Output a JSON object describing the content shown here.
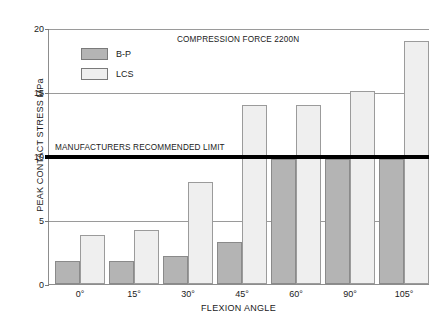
{
  "chart_data": {
    "type": "bar",
    "title": "",
    "annotation": "COMPRESSION FORCE 2200N",
    "xlabel": "FLEXION ANGLE",
    "ylabel": "PEAK CONTACT STRESS MPa",
    "categories": [
      "0°",
      "15°",
      "30°",
      "45°",
      "60°",
      "90°",
      "105°"
    ],
    "series": [
      {
        "name": "B-P",
        "color": "#b4b4b4",
        "values": [
          1.8,
          1.8,
          2.2,
          3.3,
          9.8,
          9.8,
          9.8
        ]
      },
      {
        "name": "LCS",
        "color": "#efefef",
        "values": [
          3.8,
          4.2,
          8.0,
          14.0,
          14.0,
          15.1,
          19.0
        ]
      }
    ],
    "ylim": [
      0,
      20
    ],
    "yticks": [
      0,
      5,
      10,
      15,
      20
    ],
    "ytick_labels": [
      "0",
      "5",
      "10",
      "15",
      "20"
    ],
    "grid": true,
    "legend_position": "upper-left",
    "reference_line": {
      "value": 10,
      "label": "MANUFACTURERS RECOMMENDED LIMIT",
      "color": "#000000"
    }
  }
}
